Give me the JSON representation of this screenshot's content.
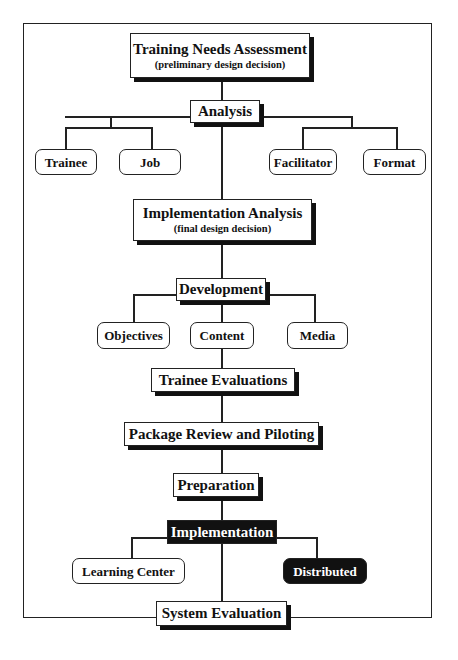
{
  "diagram": {
    "title_node": {
      "label": "Training Needs Assessment",
      "sublabel": "(preliminary design decision)"
    },
    "analysis": {
      "label": "Analysis",
      "children": [
        "Trainee",
        "Job",
        "Facilitator",
        "Format"
      ]
    },
    "implementation_analysis": {
      "label": "Implementation Analysis",
      "sublabel": "(final design decision)"
    },
    "development": {
      "label": "Development",
      "children": [
        "Objectives",
        "Content",
        "Media"
      ]
    },
    "trainee_evaluations": {
      "label": "Trainee Evaluations"
    },
    "package_review": {
      "label": "Package Review and Piloting"
    },
    "preparation": {
      "label": "Preparation"
    },
    "implementation": {
      "label": "Implementation",
      "children": [
        "Learning Center",
        "Distributed"
      ]
    },
    "system_evaluation": {
      "label": "System Evaluation"
    },
    "colors": {
      "line": "#222222",
      "dark_fill": "#111111",
      "background": "#ffffff"
    }
  }
}
